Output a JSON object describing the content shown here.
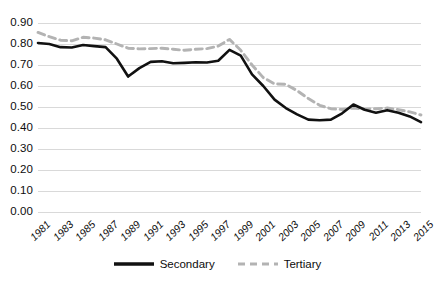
{
  "chart_data": {
    "type": "line",
    "title": "",
    "subtitle": "",
    "xlabel": "",
    "ylabel": "",
    "ylim": [
      0.0,
      0.9
    ],
    "ytick_labels": [
      "0.90",
      "0.80",
      "0.70",
      "0.60",
      "0.50",
      "0.40",
      "0.30",
      "0.20",
      "0.10",
      "0.00"
    ],
    "ytick_values": [
      0.9,
      0.8,
      0.7,
      0.6,
      0.5,
      0.4,
      0.3,
      0.2,
      0.1,
      0.0
    ],
    "grid": "horizontal",
    "legend_position": "bottom",
    "x": [
      1981,
      1982,
      1983,
      1984,
      1985,
      1986,
      1987,
      1988,
      1989,
      1990,
      1991,
      1992,
      1993,
      1994,
      1995,
      1996,
      1997,
      1998,
      1999,
      2000,
      2001,
      2002,
      2003,
      2004,
      2005,
      2006,
      2007,
      2008,
      2009,
      2010,
      2011,
      2012,
      2013,
      2014,
      2015
    ],
    "xtick_labels": [
      "1981",
      "1983",
      "1985",
      "1987",
      "1989",
      "1991",
      "1993",
      "1995",
      "1997",
      "1999",
      "2001",
      "2003",
      "2005",
      "2007",
      "2009",
      "2011",
      "2013",
      "2015"
    ],
    "xtick_values": [
      1981,
      1983,
      1985,
      1987,
      1989,
      1991,
      1993,
      1995,
      1997,
      1999,
      2001,
      2003,
      2005,
      2007,
      2009,
      2011,
      2013,
      2015
    ],
    "series": [
      {
        "name": "Secondary",
        "style": "solid",
        "color": "#111111",
        "values": [
          0.805,
          0.8,
          0.785,
          0.783,
          0.795,
          0.79,
          0.785,
          0.73,
          0.645,
          0.685,
          0.715,
          0.718,
          0.708,
          0.71,
          0.713,
          0.712,
          0.72,
          0.772,
          0.745,
          0.655,
          0.6,
          0.535,
          0.495,
          0.465,
          0.44,
          0.437,
          0.44,
          0.47,
          0.512,
          0.487,
          0.473,
          0.485,
          0.473,
          0.455,
          0.428
        ]
      },
      {
        "name": "Tertiary",
        "style": "dashed",
        "color": "#b3b3b3",
        "values": [
          0.855,
          0.835,
          0.818,
          0.815,
          0.832,
          0.828,
          0.82,
          0.8,
          0.78,
          0.777,
          0.778,
          0.78,
          0.775,
          0.77,
          0.775,
          0.778,
          0.79,
          0.822,
          0.77,
          0.7,
          0.64,
          0.61,
          0.608,
          0.578,
          0.54,
          0.508,
          0.492,
          0.488,
          0.495,
          0.49,
          0.492,
          0.495,
          0.487,
          0.477,
          0.462
        ]
      }
    ]
  },
  "legend": {
    "entries": [
      {
        "label": "Secondary",
        "key": "solid-line-key"
      },
      {
        "label": "Tertiary",
        "key": "dashed-line-key"
      }
    ]
  },
  "colors": {
    "secondary_line": "#111111",
    "tertiary_line": "#b3b3b3",
    "gridline": "#d9d9d9",
    "text": "#0d0d0d",
    "background": "#ffffff"
  }
}
